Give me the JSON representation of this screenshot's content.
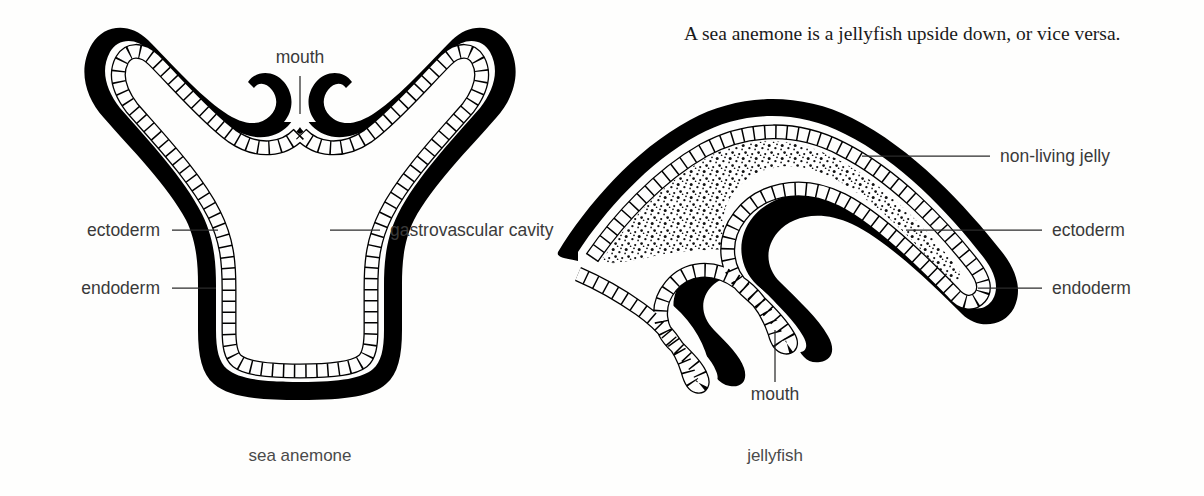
{
  "figure": {
    "caption": "A sea anemone is a jellyfish upside down, or vice versa.",
    "background_color": "#fefefd",
    "ink_color": "#000000",
    "label_color": "#3a3a3a"
  },
  "anemone": {
    "name": "sea anemone",
    "labels": {
      "mouth": "mouth",
      "ectoderm": "ectoderm",
      "endoderm": "endoderm",
      "gastrovascular_cavity": "gastrovascular cavity"
    }
  },
  "jellyfish": {
    "name": "jellyfish",
    "labels": {
      "non_living_jelly": "non-living jelly",
      "ectoderm": "ectoderm",
      "endoderm": "endoderm",
      "mouth": "mouth"
    }
  }
}
